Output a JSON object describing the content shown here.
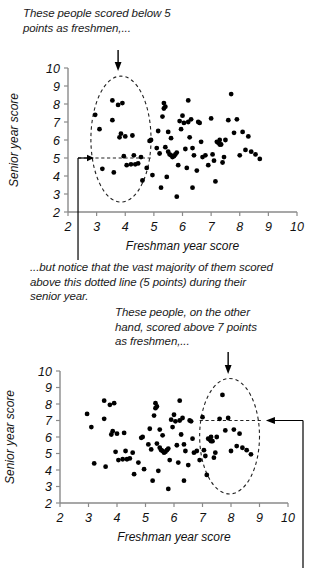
{
  "annotations": {
    "top": "These people scored below 5\npoints as freshmen,...",
    "middle": "...but notice that the vast majority of them scored\nabove this dotted line (5 points) during their\nsenior year.",
    "bottom": "These people, on the other\nhand, scored above 7 points\nas freshmen,..."
  },
  "chart_data": [
    {
      "id": "chart1",
      "type": "scatter",
      "title": "",
      "xlabel": "Freshman year score",
      "ylabel": "Senior year score",
      "xlim": [
        2,
        10
      ],
      "ylim": [
        2,
        10
      ],
      "xticks": [
        2,
        3,
        4,
        5,
        6,
        7,
        8,
        9,
        10
      ],
      "yticks": [
        2,
        3,
        4,
        5,
        6,
        7,
        8,
        9,
        10
      ],
      "grid": false,
      "legend": "none",
      "annotations": {
        "highlight_ellipse": {
          "cx": 3.85,
          "cy": 6.05,
          "rx": 1.05,
          "ry": 3.5
        },
        "reference_line_y": 5,
        "reference_line_x_from": 2.35,
        "reference_line_x_to": 4.9,
        "arrow_down_x": 3.75
      },
      "points": [
        [
          2.95,
          7.4
        ],
        [
          3.1,
          6.6
        ],
        [
          3.2,
          4.4
        ],
        [
          3.55,
          8.2
        ],
        [
          3.55,
          7.1
        ],
        [
          3.6,
          4.2
        ],
        [
          3.75,
          7.95
        ],
        [
          3.8,
          6.15
        ],
        [
          3.85,
          6.35
        ],
        [
          3.9,
          8.05
        ],
        [
          3.95,
          5.1
        ],
        [
          4.0,
          6.2
        ],
        [
          4.05,
          4.6
        ],
        [
          4.2,
          4.65
        ],
        [
          4.25,
          6.25
        ],
        [
          4.3,
          5.15
        ],
        [
          4.35,
          4.65
        ],
        [
          4.45,
          4.7
        ],
        [
          4.55,
          5.05
        ],
        [
          4.6,
          3.75
        ],
        [
          4.75,
          4.45
        ],
        [
          4.85,
          5.95
        ],
        [
          4.9,
          6.0
        ],
        [
          4.95,
          4.05
        ],
        [
          5.1,
          5.55
        ],
        [
          5.15,
          6.5
        ],
        [
          5.2,
          5.25
        ],
        [
          5.25,
          3.35
        ],
        [
          5.3,
          7.3
        ],
        [
          5.35,
          7.75
        ],
        [
          5.35,
          8.05
        ],
        [
          5.4,
          7.85
        ],
        [
          5.4,
          5.6
        ],
        [
          5.45,
          3.95
        ],
        [
          5.5,
          6.45
        ],
        [
          5.5,
          5.35
        ],
        [
          5.55,
          5.2
        ],
        [
          5.6,
          5.15
        ],
        [
          5.6,
          6.1
        ],
        [
          5.65,
          5.05
        ],
        [
          5.7,
          5.1
        ],
        [
          5.75,
          5.2
        ],
        [
          5.8,
          2.85
        ],
        [
          5.8,
          5.3
        ],
        [
          5.85,
          4.6
        ],
        [
          5.9,
          7.05
        ],
        [
          5.95,
          6.6
        ],
        [
          6.0,
          7.35
        ],
        [
          6.05,
          6.95
        ],
        [
          6.1,
          5.5
        ],
        [
          6.15,
          4.45
        ],
        [
          6.2,
          8.2
        ],
        [
          6.2,
          7.0
        ],
        [
          6.25,
          6.15
        ],
        [
          6.3,
          7.15
        ],
        [
          6.35,
          5.55
        ],
        [
          6.35,
          3.35
        ],
        [
          6.4,
          5.15
        ],
        [
          6.5,
          4.3
        ],
        [
          6.55,
          7.0
        ],
        [
          6.6,
          6.95
        ],
        [
          6.65,
          5.9
        ],
        [
          6.7,
          5.05
        ],
        [
          6.8,
          5.15
        ],
        [
          6.9,
          4.6
        ],
        [
          7.0,
          7.2
        ],
        [
          7.05,
          5.2
        ],
        [
          7.1,
          4.85
        ],
        [
          7.15,
          3.7
        ],
        [
          7.2,
          5.9
        ],
        [
          7.25,
          5.85
        ],
        [
          7.3,
          5.75
        ],
        [
          7.3,
          6.0
        ],
        [
          7.35,
          5.75
        ],
        [
          7.4,
          4.75
        ],
        [
          7.45,
          5.05
        ],
        [
          7.5,
          6.0
        ],
        [
          7.6,
          7.1
        ],
        [
          7.7,
          8.55
        ],
        [
          7.8,
          6.4
        ],
        [
          7.9,
          7.15
        ],
        [
          8.0,
          5.15
        ],
        [
          8.1,
          6.45
        ],
        [
          8.2,
          5.45
        ],
        [
          8.3,
          6.2
        ],
        [
          8.4,
          5.35
        ],
        [
          8.55,
          5.2
        ],
        [
          8.7,
          4.95
        ]
      ]
    },
    {
      "id": "chart2",
      "type": "scatter",
      "title": "",
      "xlabel": "Freshman year score",
      "ylabel": "Senior year score",
      "xlim": [
        2,
        10
      ],
      "ylim": [
        2,
        10
      ],
      "xticks": [
        2,
        3,
        4,
        5,
        6,
        7,
        8,
        9,
        10
      ],
      "yticks": [
        2,
        3,
        4,
        5,
        6,
        7,
        8,
        9,
        10
      ],
      "grid": false,
      "legend": "none",
      "annotations": {
        "highlight_ellipse": {
          "cx": 7.95,
          "cy": 6.05,
          "rx": 1.05,
          "ry": 3.5
        },
        "reference_line_y": 7,
        "reference_line_x_from": 6.9,
        "reference_line_x_to": 9.1,
        "arrow_down_x": 7.9,
        "arrow_right_to_x": 9.05
      },
      "points": [
        [
          2.95,
          7.4
        ],
        [
          3.1,
          6.6
        ],
        [
          3.2,
          4.4
        ],
        [
          3.55,
          8.2
        ],
        [
          3.55,
          7.1
        ],
        [
          3.6,
          4.2
        ],
        [
          3.75,
          7.95
        ],
        [
          3.8,
          6.15
        ],
        [
          3.85,
          6.35
        ],
        [
          3.9,
          8.05
        ],
        [
          3.95,
          5.1
        ],
        [
          4.0,
          6.2
        ],
        [
          4.05,
          4.6
        ],
        [
          4.2,
          4.65
        ],
        [
          4.25,
          6.25
        ],
        [
          4.3,
          5.15
        ],
        [
          4.35,
          4.65
        ],
        [
          4.45,
          4.7
        ],
        [
          4.55,
          5.05
        ],
        [
          4.6,
          3.75
        ],
        [
          4.75,
          4.45
        ],
        [
          4.85,
          5.95
        ],
        [
          4.9,
          6.0
        ],
        [
          4.95,
          4.05
        ],
        [
          5.1,
          5.55
        ],
        [
          5.15,
          6.5
        ],
        [
          5.2,
          5.25
        ],
        [
          5.25,
          3.35
        ],
        [
          5.3,
          7.3
        ],
        [
          5.35,
          7.75
        ],
        [
          5.35,
          8.05
        ],
        [
          5.4,
          7.85
        ],
        [
          5.4,
          5.6
        ],
        [
          5.45,
          3.95
        ],
        [
          5.5,
          6.45
        ],
        [
          5.5,
          5.35
        ],
        [
          5.55,
          5.2
        ],
        [
          5.6,
          5.15
        ],
        [
          5.6,
          6.1
        ],
        [
          5.65,
          5.05
        ],
        [
          5.7,
          5.1
        ],
        [
          5.75,
          5.2
        ],
        [
          5.8,
          2.85
        ],
        [
          5.8,
          5.3
        ],
        [
          5.85,
          4.6
        ],
        [
          5.9,
          7.05
        ],
        [
          5.95,
          6.6
        ],
        [
          6.0,
          7.35
        ],
        [
          6.05,
          6.95
        ],
        [
          6.1,
          5.5
        ],
        [
          6.15,
          4.45
        ],
        [
          6.2,
          8.2
        ],
        [
          6.2,
          7.0
        ],
        [
          6.25,
          6.15
        ],
        [
          6.3,
          7.15
        ],
        [
          6.35,
          5.55
        ],
        [
          6.35,
          3.35
        ],
        [
          6.4,
          5.15
        ],
        [
          6.5,
          4.3
        ],
        [
          6.55,
          7.0
        ],
        [
          6.6,
          6.95
        ],
        [
          6.65,
          5.9
        ],
        [
          6.7,
          5.05
        ],
        [
          6.8,
          5.15
        ],
        [
          6.9,
          4.6
        ],
        [
          7.0,
          7.2
        ],
        [
          7.05,
          5.2
        ],
        [
          7.1,
          4.85
        ],
        [
          7.15,
          3.7
        ],
        [
          7.2,
          5.9
        ],
        [
          7.25,
          5.85
        ],
        [
          7.3,
          5.75
        ],
        [
          7.3,
          6.0
        ],
        [
          7.35,
          5.75
        ],
        [
          7.4,
          4.75
        ],
        [
          7.45,
          5.05
        ],
        [
          7.5,
          6.0
        ],
        [
          7.6,
          7.1
        ],
        [
          7.7,
          8.55
        ],
        [
          7.8,
          6.4
        ],
        [
          7.9,
          7.15
        ],
        [
          8.0,
          5.15
        ],
        [
          8.1,
          6.45
        ],
        [
          8.2,
          5.45
        ],
        [
          8.3,
          6.2
        ],
        [
          8.4,
          5.35
        ],
        [
          8.55,
          5.2
        ],
        [
          8.7,
          4.95
        ]
      ]
    }
  ]
}
